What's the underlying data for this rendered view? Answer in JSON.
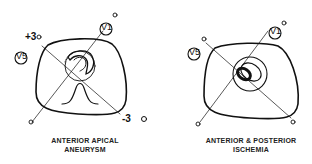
{
  "panels": [
    {
      "caption_line1": "ANTERIOR APICAL",
      "caption_line2": "ANEURYSM",
      "leads": {
        "v1": "V1",
        "v5": "V5"
      },
      "markers": {
        "plus": "+3",
        "minus": "-3"
      }
    },
    {
      "caption_line1": "ANTERIOR & POSTERIOR",
      "caption_line2": "ISCHEMIA",
      "leads": {
        "v1": "V1",
        "v5": "V5"
      }
    }
  ]
}
